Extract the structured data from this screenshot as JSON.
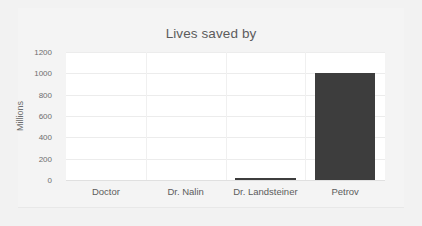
{
  "chart_data": {
    "type": "bar",
    "title": "Lives saved by",
    "xlabel": "",
    "ylabel": "Millions",
    "categories": [
      "Doctor",
      "Dr. Nalin",
      "Dr. Landsteiner",
      "Petrov"
    ],
    "values": [
      0,
      0,
      15,
      1000
    ],
    "ylim": [
      0,
      1200
    ],
    "yticks": [
      0,
      200,
      400,
      600,
      800,
      1000,
      1200
    ],
    "ytick_labels": [
      "0",
      "200",
      "400",
      "600",
      "800",
      "1000",
      "1200"
    ],
    "grid": true,
    "legend": false,
    "series": [
      {
        "name": "Lives saved",
        "values": [
          0,
          0,
          15,
          1000
        ],
        "color": "#3d3d3d"
      }
    ]
  },
  "colors": {
    "bar": "#3d3d3d",
    "plot_background": "#ffffff",
    "page_background": "#f2f2f2",
    "gridline": "#ececec",
    "text": "#5c5c5c"
  }
}
